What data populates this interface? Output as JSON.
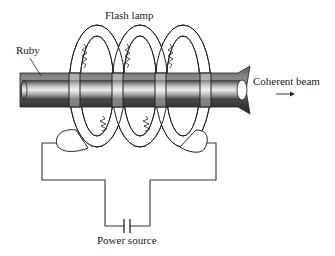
{
  "diagram": {
    "labels": {
      "flash_lamp": "Flash lamp",
      "ruby": "Ruby",
      "coherent_beam": "Coherent beam",
      "power_source": "Power source"
    },
    "components": [
      {
        "id": "ruby-rod",
        "name": "Ruby"
      },
      {
        "id": "flash-lamp-coil",
        "name": "Flash lamp",
        "turns": 3
      },
      {
        "id": "power-source",
        "name": "Power source",
        "symbol": "capacitor"
      },
      {
        "id": "beam-arrow",
        "name": "Coherent beam",
        "direction": "right"
      }
    ],
    "colors": {
      "line": "#222222",
      "rod_dark": "#3a3a3a",
      "rod_light": "#e6e6e6",
      "background": "#ffffff"
    }
  }
}
